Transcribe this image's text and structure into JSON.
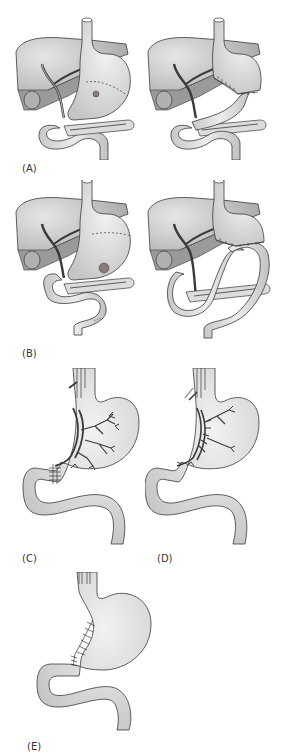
{
  "figure": {
    "panels": [
      {
        "id": "A",
        "label": "(A)",
        "description": "Stomach with ulcer and dashed resection line; Billroth I style reconstruction with gastroduodenal anastomosis"
      },
      {
        "id": "B",
        "label": "(B)",
        "description": "Stomach with ulcer and dashed resection line; Billroth II style gastrojejunostomy with afferent and efferent loops"
      },
      {
        "id": "C",
        "label": "(C)",
        "description": "Stomach with vagus nerve branches and stitched pyloroplasty"
      },
      {
        "id": "D",
        "label": "(D)",
        "description": "Highly selective vagotomy with cut nerve branches along lesser curvature"
      },
      {
        "id": "E",
        "label": "(E)",
        "description": "Stomach with sutured lesser curvature and pylorus"
      }
    ]
  },
  "colors": {
    "organ_fill": "#d4d4d4",
    "liver_fill": "#bdbdbd",
    "liver_shadow": "#9a9a9a",
    "outline": "#3a3a3a",
    "nerve": "#4a4a4a",
    "ulcer": "#8a7a7a",
    "background": "#ffffff"
  }
}
